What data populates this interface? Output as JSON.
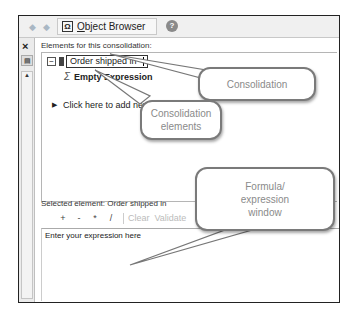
{
  "toolbar": {
    "back_icon": "arrow-left-icon",
    "forward_icon": "arrow-right-icon",
    "object_browser_label_first": "O",
    "object_browser_label_rest": "bject Browser",
    "help_icon": "help-icon"
  },
  "left_strip": {
    "close_label": "×"
  },
  "elements_panel": {
    "label": "Elements for this consolidation:",
    "consolidation_name": "Order shipped in",
    "child_element": "Empty Expression",
    "add_new_label": "Click here to add new consolidation"
  },
  "selected_panel": {
    "label": "Selected element: Order shipped in",
    "operators": [
      "+",
      "-",
      "*",
      "/"
    ],
    "clear_label": "Clear",
    "validate_label": "Validate",
    "expression_placeholder": "Enter your expression here"
  },
  "callouts": {
    "consolidation": "Consolidation",
    "consolidation_elements": "Consolidation elements",
    "formula_window": "Formula/ expression window"
  },
  "colors": {
    "toolbar_bg": "#f0f0f0",
    "callout_border": "#7a7a7a",
    "callout_text": "#8a8a8a"
  }
}
